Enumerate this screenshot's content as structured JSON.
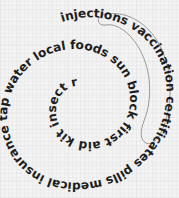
{
  "canvas": {
    "width": 179,
    "height": 198,
    "background_color": "#f3f3f3",
    "texture": "fine-grid-paper"
  },
  "word_spiral": {
    "full_text": "injections vaccination certificates pills medical insurance tap water local foods sun block first aid kit insect repellent mosquito net emergency",
    "text_color": "#1d1d1d",
    "direction": "clockwise-inward",
    "words": [
      "injections",
      "vaccination",
      "certificates",
      "pills",
      "medical",
      "insurance",
      "tap",
      "water",
      "local",
      "foods",
      "sun",
      "block",
      "first",
      "aid",
      "kit",
      "insect",
      "repellent",
      "mosquito",
      "net",
      "emergency"
    ]
  },
  "highlight": {
    "phrase": "vaccination certificates",
    "shape": "oval-outline",
    "stroke_color": "#8d8d8d"
  }
}
